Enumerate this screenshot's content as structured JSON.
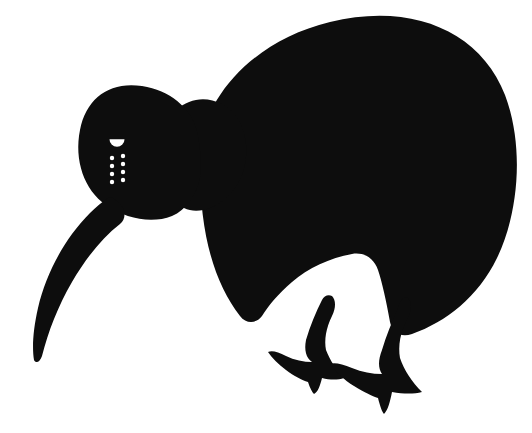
{
  "image": {
    "subject": "kiwi-bird-silhouette",
    "title": "Kiwi",
    "width": 532,
    "height": 433,
    "background_color": "#ffffff",
    "silhouette_color": "#0d0d0d",
    "detail_color": "#ffffff",
    "style": "flat solid silhouette, side profile facing left"
  },
  "parts": {
    "body": {
      "name": "body",
      "description": "large rounded oval body",
      "path": "M 200 150 C 205 95 255 40 330 22 C 410 2 480 30 505 95 C 525 148 518 215 497 258 C 478 297 446 322 412 334 C 400 338 392 332 390 322 C 386 300 382 282 378 270 C 374 258 364 252 352 254 C 330 258 308 268 292 282 C 278 294 268 306 262 316 C 256 324 246 324 240 316 C 214 282 198 232 200 150 Z"
    },
    "head": {
      "name": "head",
      "description": "head lobe on the left, joined to body at the neck",
      "path": "M 196 128 C 190 108 170 90 142 86 C 110 81 86 98 80 130 C 74 160 84 190 106 205 C 126 219 152 224 172 216 C 186 210 196 196 200 178 C 202 164 200 142 196 128 Z"
    },
    "neck": {
      "name": "neck",
      "description": "junction between head and body",
      "path": "M 176 110 C 190 98 206 96 222 104 C 236 111 244 126 246 144 C 248 166 240 186 226 198 C 212 210 196 214 184 208 C 172 202 166 188 168 170 C 170 146 172 124 176 110 Z"
    },
    "beak": {
      "name": "beak",
      "description": "long slender curved beak pointing down-left",
      "path": "M 108 198 C 96 206 84 218 72 234 C 56 256 44 282 38 308 C 33 330 32 348 34 360 C 36 364 40 362 42 356 C 48 332 58 306 72 282 C 86 258 102 238 120 224 C 126 219 126 210 120 204 C 116 200 112 196 108 198 Z"
    },
    "leg_back": {
      "name": "leg-back",
      "description": "rear leg with three-toed foot, pointing left",
      "path": "M 322 300 C 316 312 310 326 306 340 C 304 350 306 358 312 362 C 304 362 294 360 286 356 C 278 352 272 350 268 352 C 272 358 278 364 286 370 C 294 376 302 380 308 382 C 310 388 312 392 314 394 C 318 392 320 386 322 378 C 330 380 338 380 344 378 C 336 370 330 360 326 350 C 324 340 326 328 332 316 C 336 308 336 300 332 296 C 328 294 324 296 322 300 Z"
    },
    "leg_front": {
      "name": "leg-front",
      "description": "front leg with three-toed foot, pointing left",
      "path": "M 398 308 C 392 322 386 336 382 350 C 378 360 378 368 382 374 C 372 374 362 372 352 368 C 342 364 334 362 330 364 C 336 372 344 380 354 386 C 364 392 372 396 378 398 C 380 406 382 412 384 414 C 388 410 390 402 392 392 C 404 394 414 394 422 392 C 412 382 404 370 400 358 C 398 346 400 332 408 318 C 412 310 412 302 408 298 C 404 296 400 300 398 308 Z"
    },
    "eye": {
      "name": "eye",
      "description": "white half-disc eye marking",
      "cx": 117,
      "cy": 141,
      "rx": 7.5,
      "ry": 7.5
    },
    "cheek_dots": {
      "name": "cheek-dots",
      "description": "two columns of small white dots below the eye",
      "columns": [
        {
          "x": 112,
          "ys": [
            158,
            166,
            174,
            182
          ]
        },
        {
          "x": 123,
          "ys": [
            156,
            164,
            172,
            180
          ]
        }
      ],
      "radius": 2.2
    }
  }
}
